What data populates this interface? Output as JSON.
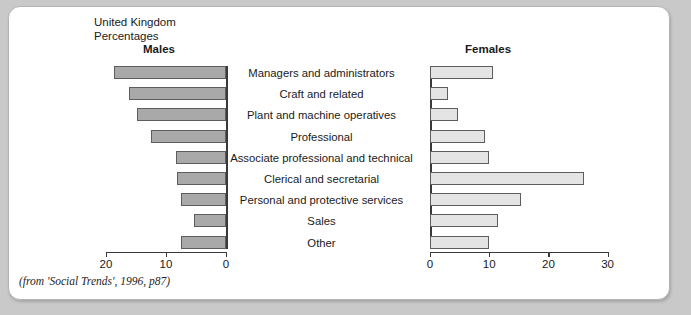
{
  "figure": {
    "region": "United Kingdom",
    "units": "Percentages",
    "caption": "(from 'Social Trends', 1996, p87)"
  },
  "chart_data": {
    "type": "bar",
    "orientation": "horizontal",
    "layout": "population-pyramid",
    "title": "United Kingdom",
    "subtitle": "Percentages",
    "xlabel": "Percentages",
    "ylabel": "",
    "grid": false,
    "legend_position": "top",
    "categories": [
      "Managers and administrators",
      "Craft and related",
      "Plant and machine operatives",
      "Professional",
      "Associate professional and technical",
      "Clerical and secretarial",
      "Personal and protective services",
      "Sales",
      "Other"
    ],
    "series": [
      {
        "name": "Males",
        "axis_side": "left",
        "axis_ticks": [
          20,
          10,
          0
        ],
        "axis_reversed": true,
        "xlim": [
          0,
          20
        ],
        "color": "#a9a9a9",
        "values": [
          18.7,
          16.2,
          14.8,
          12.5,
          8.3,
          8.2,
          7.5,
          5.3,
          7.5
        ]
      },
      {
        "name": "Females",
        "axis_side": "right",
        "axis_ticks": [
          0,
          10,
          20,
          30
        ],
        "axis_reversed": false,
        "xlim": [
          0,
          30
        ],
        "color": "#e4e4e4",
        "values": [
          10.7,
          3.1,
          4.7,
          9.3,
          10.0,
          26.0,
          15.4,
          11.5,
          9.9
        ]
      }
    ]
  }
}
